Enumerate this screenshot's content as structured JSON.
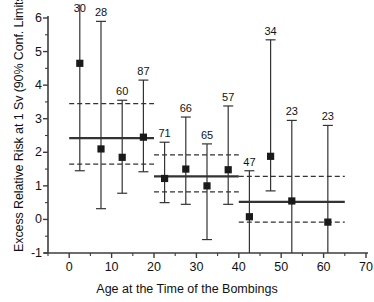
{
  "chart_data": {
    "type": "scatter",
    "title": "",
    "xlabel": "Age at the Time of the Bombings",
    "ylabel": "Excess Relative Risk at 1 Sv (90% Conf. Limits)",
    "xlim": [
      -5,
      70
    ],
    "ylim": [
      -1,
      6
    ],
    "xticks": [
      0,
      10,
      20,
      30,
      40,
      50,
      60,
      70
    ],
    "yticks": [
      -1,
      0,
      1,
      2,
      3,
      4,
      5,
      6
    ],
    "xtick_labels": [
      "0",
      "10",
      "20",
      "30",
      "40",
      "50",
      "60",
      "70"
    ],
    "ytick_labels": [
      "-1",
      "0",
      "1",
      "2",
      "3",
      "4",
      "5",
      "6"
    ],
    "grid": false,
    "legend": "none",
    "minor_ticks": true,
    "x": [
      2.5,
      7.5,
      12.5,
      17.5,
      22.5,
      27.5,
      32.5,
      37.5,
      42.5,
      47.5,
      52.5,
      61.0
    ],
    "values": [
      4.65,
      2.1,
      1.85,
      2.45,
      1.22,
      1.5,
      1.0,
      1.48,
      0.08,
      1.88,
      0.55,
      -0.08
    ],
    "ci_low": [
      1.45,
      0.32,
      0.78,
      1.42,
      0.5,
      0.45,
      -0.6,
      0.45,
      -1.0,
      0.85,
      -1.0,
      -1.0
    ],
    "ci_high": [
      6.4,
      5.9,
      3.55,
      4.15,
      2.3,
      3.05,
      2.25,
      3.38,
      1.45,
      5.35,
      2.95,
      2.8
    ],
    "point_labels": [
      "30",
      "28",
      "60",
      "87",
      "71",
      "66",
      "65",
      "57",
      "47",
      "34",
      "23",
      "23"
    ],
    "label_note": "number of cases above each confidence interval",
    "bands": [
      {
        "x_start": 0.0,
        "x_end": 20.0,
        "fit": 2.42,
        "lower": 1.65,
        "upper": 3.45
      },
      {
        "x_start": 20.0,
        "x_end": 40.0,
        "fit": 1.28,
        "lower": 0.82,
        "upper": 1.92
      },
      {
        "x_start": 40.0,
        "x_end": 65.0,
        "fit": 0.52,
        "lower": -0.08,
        "upper": 1.28
      }
    ]
  },
  "style": {
    "marker_color": "#1a1a1a",
    "line_color": "#333333",
    "axis_color": "#3d3d3d",
    "background": "#ffffff"
  }
}
